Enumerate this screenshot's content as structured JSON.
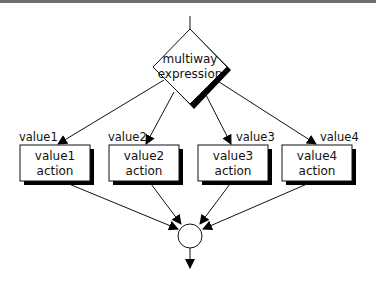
{
  "diagram": {
    "decision": {
      "line1": "multiway",
      "line2": "expression"
    },
    "branches": [
      {
        "edge_label": "value1",
        "line1": "value1",
        "line2": "action"
      },
      {
        "edge_label": "value2",
        "line1": "value2",
        "line2": "action"
      },
      {
        "edge_label": "value3",
        "line1": "value3",
        "line2": "action"
      },
      {
        "edge_label": "value4",
        "line1": "value4",
        "line2": "action"
      }
    ],
    "merge_node": "circle",
    "colors": {
      "stroke": "#111111",
      "shadow": "#000000",
      "fill": "#ffffff",
      "topbar": "#6e6e6e"
    }
  }
}
